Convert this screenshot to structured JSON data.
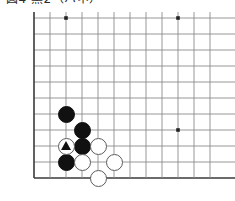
{
  "caption": {
    "text": "図4  黒2（ハネ）"
  },
  "board": {
    "name": "go-board",
    "type": "go-diagram",
    "geometry": {
      "origin_x": 34,
      "origin_y": 6,
      "spacing": 16,
      "cols": 12,
      "rows": 11,
      "stone_radius": 8.5
    },
    "colors": {
      "line": "#8c8c8c",
      "edge_line": "#3a3a3a",
      "black_stone": "#111111",
      "white_stone": "#ffffff",
      "white_stone_border": "#5c5c5c",
      "star_point": "#222222",
      "background": "#ffffff"
    },
    "edges": {
      "left": true,
      "bottom": true,
      "top": false,
      "right": false
    },
    "star_points": [
      {
        "col": 3,
        "row": 1
      },
      {
        "col": 10,
        "row": 1
      },
      {
        "col": 3,
        "row": 7
      },
      {
        "col": 10,
        "row": 8
      }
    ],
    "stones": [
      {
        "col": 3,
        "row": 7,
        "color": "black",
        "mark": ""
      },
      {
        "col": 4,
        "row": 8,
        "color": "black",
        "mark": ""
      },
      {
        "col": 4,
        "row": 9,
        "color": "black",
        "mark": ""
      },
      {
        "col": 3,
        "row": 10,
        "color": "black",
        "mark": ""
      },
      {
        "col": 3,
        "row": 9,
        "color": "white",
        "mark": "triangle"
      },
      {
        "col": 5,
        "row": 9,
        "color": "white",
        "mark": ""
      },
      {
        "col": 4,
        "row": 10,
        "color": "white",
        "mark": ""
      },
      {
        "col": 6,
        "row": 10,
        "color": "white",
        "mark": ""
      },
      {
        "col": 5,
        "row": 11,
        "color": "white",
        "mark": ""
      }
    ]
  }
}
